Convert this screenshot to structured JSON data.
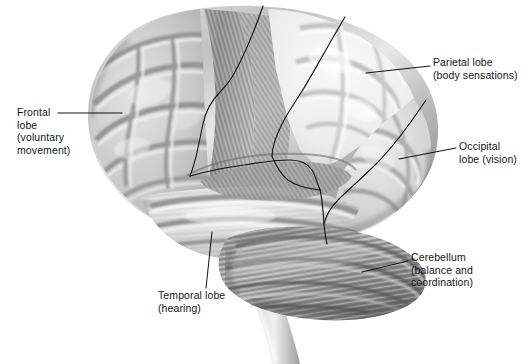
{
  "figure": {
    "background_color": "#ffffff",
    "text_color": "#161616",
    "line_color": "#111111"
  },
  "labels": {
    "frontal": {
      "name": "Frontal lobe",
      "lines": [
        "Frontal",
        "lobe",
        "(voluntary",
        "movement)"
      ],
      "text": "Frontal\nlobe\n(voluntary\nmovement)"
    },
    "parietal": {
      "name": "Parietal lobe",
      "lines": [
        "Parietal lobe",
        "(body sensations)"
      ],
      "text": "Parietal lobe\n(body sensations)"
    },
    "occipital": {
      "name": "Occipital lobe",
      "lines": [
        "Occipital",
        "lobe (vision)"
      ],
      "text": "Occipital\nlobe (vision)"
    },
    "cerebellum": {
      "name": "Cerebellum",
      "lines": [
        "Cerebellum",
        "(balance and",
        "coordination)"
      ],
      "text": "Cerebellum\n(balance and\ncoordination)"
    },
    "temporal": {
      "name": "Temporal lobe",
      "lines": [
        "Temporal lobe",
        "(hearing)"
      ],
      "text": "Temporal lobe\n(hearing)"
    }
  },
  "footnote": {
    "text": "·· ··    ·  ·    ·"
  },
  "structures": [
    "frontal-lobe",
    "parietal-lobe",
    "occipital-lobe",
    "temporal-lobe",
    "cerebellum",
    "brainstem"
  ]
}
